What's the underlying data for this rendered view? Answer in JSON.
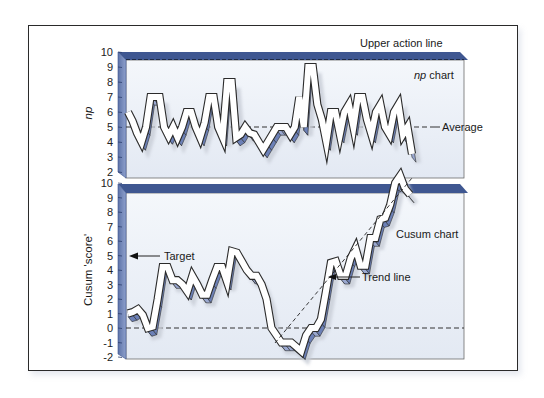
{
  "chart_data": [
    {
      "type": "line",
      "name": "np chart",
      "title": "np chart",
      "ylabel": "np",
      "xlabel": "",
      "ylim": [
        2,
        10
      ],
      "yticks": [
        2,
        3,
        4,
        5,
        6,
        7,
        8,
        9,
        10
      ],
      "grid": false,
      "reference_lines": [
        {
          "label": "Upper action line",
          "y": 9.5,
          "style": "dashed"
        },
        {
          "label": "Average",
          "y": 5,
          "style": "dashed"
        }
      ],
      "values": [
        6,
        5.4,
        4.6,
        4,
        5,
        7,
        7,
        7,
        5,
        4.4,
        5,
        4.3,
        5,
        6,
        6,
        5,
        4.3,
        5.3,
        7,
        7,
        5,
        4.3,
        8,
        8,
        4.3,
        4.5,
        5,
        4.6,
        4.5,
        4,
        3.5,
        4,
        4.5,
        5,
        5,
        5,
        4.5,
        5,
        7,
        5,
        9,
        9,
        6.5,
        5.5,
        4,
        6,
        6,
        4.5,
        6,
        6.5,
        5,
        7,
        7,
        5.5,
        4.5,
        6,
        6.5,
        5,
        4.5,
        6,
        6.5,
        4.5,
        5,
        3.2
      ]
    },
    {
      "type": "line",
      "name": "Cusum chart",
      "title": "Cusum chart",
      "ylabel": "Cusum 'score'",
      "xlabel": "",
      "ylim": [
        -2,
        10
      ],
      "yticks": [
        -2,
        -1,
        0,
        1,
        2,
        3,
        4,
        5,
        6,
        7,
        8,
        9,
        10
      ],
      "grid": false,
      "reference_lines": [
        {
          "label": "Target",
          "y": 5,
          "style": "arrow"
        },
        {
          "label": "zero",
          "y": 0,
          "style": "dashed"
        },
        {
          "label": "Trend line",
          "style": "dashed",
          "from": [
            -1.6,
            0
          ],
          "to": [
            10.5,
            1
          ]
        }
      ],
      "values": [
        1,
        1.1,
        1.3,
        0.9,
        0,
        0.1,
        2,
        4.2,
        4.2,
        3.3,
        3.3,
        3,
        2.5,
        3.6,
        3,
        2.3,
        2.3,
        3.3,
        4.2,
        4.2,
        3.2,
        5.3,
        5.2,
        4.6,
        4,
        3.6,
        3.6,
        3,
        2,
        0,
        -0.5,
        -1,
        -1,
        -1,
        -1.3,
        -1.6,
        -0.5,
        0,
        0,
        0.6,
        2.5,
        4.5,
        4.6,
        3.6,
        3.6,
        4.8,
        5.5,
        4.3,
        4.3,
        6.2,
        6.2,
        7.5,
        7.6,
        8.5,
        10,
        10.5,
        9.6,
        9.2
      ]
    }
  ],
  "annotations": {
    "upper_action_line": "Upper action line",
    "np_chart": "np chart",
    "np_chart_italic": "np",
    "np_chart_suffix": " chart",
    "average": "Average",
    "target": "Target",
    "cusum_chart": "Cusum chart",
    "trend_line": "Trend line"
  },
  "axes": {
    "upper_ylabel": "np",
    "lower_ylabel": "Cusum 'score'"
  },
  "colors": {
    "panel_bg": "#e9eef6",
    "wall": "#7a8fbd",
    "wall_dark": "#3d5590",
    "ribbon_face": "#ffffff",
    "ribbon_side": "#8797c4",
    "ribbon_outline": "#2b2b2b",
    "frame": "#2a2a2a"
  }
}
